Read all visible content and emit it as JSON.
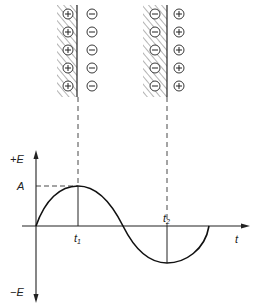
{
  "diagram": {
    "axis": {
      "y_positive_label": "+E",
      "y_negative_label": "−E",
      "x_label": "t",
      "amplitude_label": "A",
      "t1_label": "t",
      "t1_sub": "1",
      "t2_label": "t",
      "t2_sub": "2"
    },
    "plates": [
      {
        "name": "left-plate",
        "inner_charge": "+",
        "outer_charge": "−",
        "count": 5
      },
      {
        "name": "right-plate",
        "inner_charge": "−",
        "outer_charge": "+",
        "count": 5
      }
    ],
    "curve": "sine wave, one full period",
    "colors": {
      "ink": "#222222",
      "background": "#ffffff"
    }
  }
}
